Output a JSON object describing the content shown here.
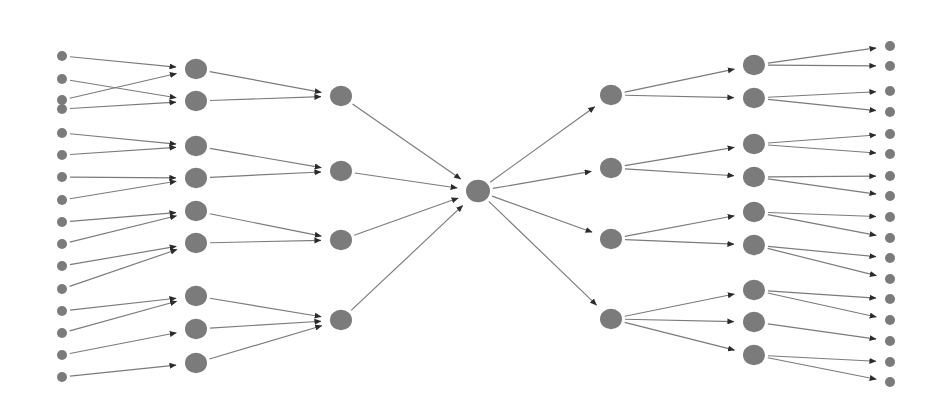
{
  "diagram": {
    "type": "hierarchical-tree-convergence-divergence",
    "title": "",
    "canvas": {
      "width": 947,
      "height": 403,
      "background": "#ffffff"
    },
    "style": {
      "node_color": "#7b7b7b",
      "edge_color": "#7b7b7b",
      "arrowhead_color": "#2b2b2b",
      "edge_width": 1.15
    },
    "columns": [
      {
        "id": "col-1",
        "name": "leaf-inputs-left",
        "node_count": 16,
        "node_radius": 5,
        "x": 62,
        "nodes": [
          {
            "id": "L1-1",
            "y": 56
          },
          {
            "id": "L1-2",
            "y": 79
          },
          {
            "id": "L1-3",
            "y": 109
          },
          {
            "id": "L1-4",
            "y": 133
          },
          {
            "id": "L1-5",
            "y": 155
          },
          {
            "id": "L1-6",
            "y": 177
          },
          {
            "id": "L1-7",
            "y": 200
          },
          {
            "id": "L1-8",
            "y": 222
          },
          {
            "id": "L1-9",
            "y": 244
          },
          {
            "id": "L1-10",
            "y": 266
          },
          {
            "id": "L1-11",
            "y": 289
          },
          {
            "id": "L1-12",
            "y": 311
          },
          {
            "id": "L1-13",
            "y": 333
          },
          {
            "id": "L1-14",
            "y": 355
          },
          {
            "id": "L1-15",
            "y": 377
          },
          {
            "id": "L1-16",
            "y": 100
          }
        ]
      },
      {
        "id": "col-2",
        "name": "mid-aggregators-left",
        "node_count": 8,
        "node_radius": 11,
        "x": 196,
        "nodes": [
          {
            "id": "L2-1",
            "y": 69
          },
          {
            "id": "L2-2",
            "y": 101
          },
          {
            "id": "L2-3",
            "y": 146
          },
          {
            "id": "L2-4",
            "y": 178
          },
          {
            "id": "L2-5",
            "y": 211
          },
          {
            "id": "L2-6",
            "y": 243
          },
          {
            "id": "L2-7",
            "y": 296
          },
          {
            "id": "L2-8",
            "y": 329
          },
          {
            "id": "L2-9",
            "y": 363
          }
        ]
      },
      {
        "id": "col-3",
        "name": "branch-collectors-left",
        "node_count": 4,
        "node_radius": 11,
        "x": 341,
        "nodes": [
          {
            "id": "L3-1",
            "y": 96
          },
          {
            "id": "L3-2",
            "y": 171
          },
          {
            "id": "L3-3",
            "y": 240
          },
          {
            "id": "L3-4",
            "y": 320
          }
        ]
      },
      {
        "id": "col-4",
        "name": "root-hub",
        "node_count": 1,
        "node_radius": 12,
        "x": 478,
        "nodes": [
          {
            "id": "ROOT",
            "y": 191
          }
        ]
      },
      {
        "id": "col-5",
        "name": "branch-distributors-right",
        "node_count": 4,
        "node_radius": 11,
        "x": 611,
        "nodes": [
          {
            "id": "R5-1",
            "y": 95
          },
          {
            "id": "R5-2",
            "y": 168
          },
          {
            "id": "R5-3",
            "y": 239
          },
          {
            "id": "R5-4",
            "y": 319
          }
        ]
      },
      {
        "id": "col-6",
        "name": "mid-distributors-right",
        "node_count": 9,
        "node_radius": 11,
        "x": 754,
        "nodes": [
          {
            "id": "R6-1",
            "y": 65
          },
          {
            "id": "R6-2",
            "y": 98
          },
          {
            "id": "R6-3",
            "y": 144
          },
          {
            "id": "R6-4",
            "y": 177
          },
          {
            "id": "R6-5",
            "y": 212
          },
          {
            "id": "R6-6",
            "y": 245
          },
          {
            "id": "R6-7",
            "y": 290
          },
          {
            "id": "R6-8",
            "y": 322
          },
          {
            "id": "R6-9",
            "y": 355
          }
        ]
      },
      {
        "id": "col-7",
        "name": "leaf-outputs-right",
        "node_count": 17,
        "node_radius": 5,
        "x": 890,
        "nodes": [
          {
            "id": "R7-1",
            "y": 46
          },
          {
            "id": "R7-2",
            "y": 66
          },
          {
            "id": "R7-3",
            "y": 91
          },
          {
            "id": "R7-4",
            "y": 112
          },
          {
            "id": "R7-5",
            "y": 134
          },
          {
            "id": "R7-6",
            "y": 154
          },
          {
            "id": "R7-7",
            "y": 176
          },
          {
            "id": "R7-8",
            "y": 196
          },
          {
            "id": "R7-9",
            "y": 217
          },
          {
            "id": "R7-10",
            "y": 238
          },
          {
            "id": "R7-11",
            "y": 258
          },
          {
            "id": "R7-12",
            "y": 279
          },
          {
            "id": "R7-13",
            "y": 299
          },
          {
            "id": "R7-14",
            "y": 320
          },
          {
            "id": "R7-15",
            "y": 341
          },
          {
            "id": "R7-16",
            "y": 362
          },
          {
            "id": "R7-17",
            "y": 382
          }
        ]
      }
    ],
    "edges": [
      {
        "from": "L1-1",
        "to": "L2-1",
        "direction": "right"
      },
      {
        "from": "L1-16",
        "to": "L2-1",
        "direction": "right"
      },
      {
        "from": "L1-2",
        "to": "L2-2",
        "direction": "right"
      },
      {
        "from": "L1-3",
        "to": "L2-2",
        "direction": "right"
      },
      {
        "from": "L1-4",
        "to": "L2-3",
        "direction": "right"
      },
      {
        "from": "L1-5",
        "to": "L2-3",
        "direction": "right"
      },
      {
        "from": "L1-6",
        "to": "L2-4",
        "direction": "right"
      },
      {
        "from": "L1-7",
        "to": "L2-4",
        "direction": "right"
      },
      {
        "from": "L1-8",
        "to": "L2-5",
        "direction": "right"
      },
      {
        "from": "L1-9",
        "to": "L2-5",
        "direction": "right"
      },
      {
        "from": "L1-10",
        "to": "L2-6",
        "direction": "right"
      },
      {
        "from": "L1-11",
        "to": "L2-6",
        "direction": "right"
      },
      {
        "from": "L1-12",
        "to": "L2-7",
        "direction": "right"
      },
      {
        "from": "L1-13",
        "to": "L2-7",
        "direction": "right"
      },
      {
        "from": "L1-14",
        "to": "L2-8",
        "direction": "right"
      },
      {
        "from": "L1-15",
        "to": "L2-9",
        "direction": "right"
      },
      {
        "from": "L2-1",
        "to": "L3-1",
        "direction": "right"
      },
      {
        "from": "L2-2",
        "to": "L3-1",
        "direction": "right"
      },
      {
        "from": "L2-3",
        "to": "L3-2",
        "direction": "right"
      },
      {
        "from": "L2-4",
        "to": "L3-2",
        "direction": "right"
      },
      {
        "from": "L2-5",
        "to": "L3-3",
        "direction": "right"
      },
      {
        "from": "L2-6",
        "to": "L3-3",
        "direction": "right"
      },
      {
        "from": "L2-7",
        "to": "L3-4",
        "direction": "right"
      },
      {
        "from": "L2-8",
        "to": "L3-4",
        "direction": "right"
      },
      {
        "from": "L2-9",
        "to": "L3-4",
        "direction": "right"
      },
      {
        "from": "L3-1",
        "to": "ROOT",
        "direction": "right"
      },
      {
        "from": "L3-2",
        "to": "ROOT",
        "direction": "right"
      },
      {
        "from": "L3-3",
        "to": "ROOT",
        "direction": "right"
      },
      {
        "from": "L3-4",
        "to": "ROOT",
        "direction": "right"
      },
      {
        "from": "ROOT",
        "to": "R5-1",
        "direction": "right"
      },
      {
        "from": "ROOT",
        "to": "R5-2",
        "direction": "right"
      },
      {
        "from": "ROOT",
        "to": "R5-3",
        "direction": "right"
      },
      {
        "from": "ROOT",
        "to": "R5-4",
        "direction": "right"
      },
      {
        "from": "R5-1",
        "to": "R6-1",
        "direction": "right"
      },
      {
        "from": "R5-1",
        "to": "R6-2",
        "direction": "right"
      },
      {
        "from": "R5-2",
        "to": "R6-3",
        "direction": "right"
      },
      {
        "from": "R5-2",
        "to": "R6-4",
        "direction": "right"
      },
      {
        "from": "R5-3",
        "to": "R6-5",
        "direction": "right"
      },
      {
        "from": "R5-3",
        "to": "R6-6",
        "direction": "right"
      },
      {
        "from": "R5-4",
        "to": "R6-7",
        "direction": "right"
      },
      {
        "from": "R5-4",
        "to": "R6-8",
        "direction": "right"
      },
      {
        "from": "R5-4",
        "to": "R6-9",
        "direction": "right"
      },
      {
        "from": "R6-1",
        "to": "R7-1",
        "direction": "right"
      },
      {
        "from": "R6-1",
        "to": "R7-2",
        "direction": "right"
      },
      {
        "from": "R6-2",
        "to": "R7-3",
        "direction": "right"
      },
      {
        "from": "R6-2",
        "to": "R7-4",
        "direction": "right"
      },
      {
        "from": "R6-3",
        "to": "R7-5",
        "direction": "right"
      },
      {
        "from": "R6-3",
        "to": "R7-6",
        "direction": "right"
      },
      {
        "from": "R6-4",
        "to": "R7-7",
        "direction": "right"
      },
      {
        "from": "R6-4",
        "to": "R7-8",
        "direction": "right"
      },
      {
        "from": "R6-5",
        "to": "R7-9",
        "direction": "right"
      },
      {
        "from": "R6-5",
        "to": "R7-10",
        "direction": "right"
      },
      {
        "from": "R6-6",
        "to": "R7-11",
        "direction": "right"
      },
      {
        "from": "R6-6",
        "to": "R7-12",
        "direction": "right"
      },
      {
        "from": "R6-7",
        "to": "R7-13",
        "direction": "right"
      },
      {
        "from": "R6-7",
        "to": "R7-14",
        "direction": "right"
      },
      {
        "from": "R6-8",
        "to": "R7-15",
        "direction": "right"
      },
      {
        "from": "R6-9",
        "to": "R7-16",
        "direction": "right"
      },
      {
        "from": "R6-9",
        "to": "R7-17",
        "direction": "right"
      }
    ]
  }
}
